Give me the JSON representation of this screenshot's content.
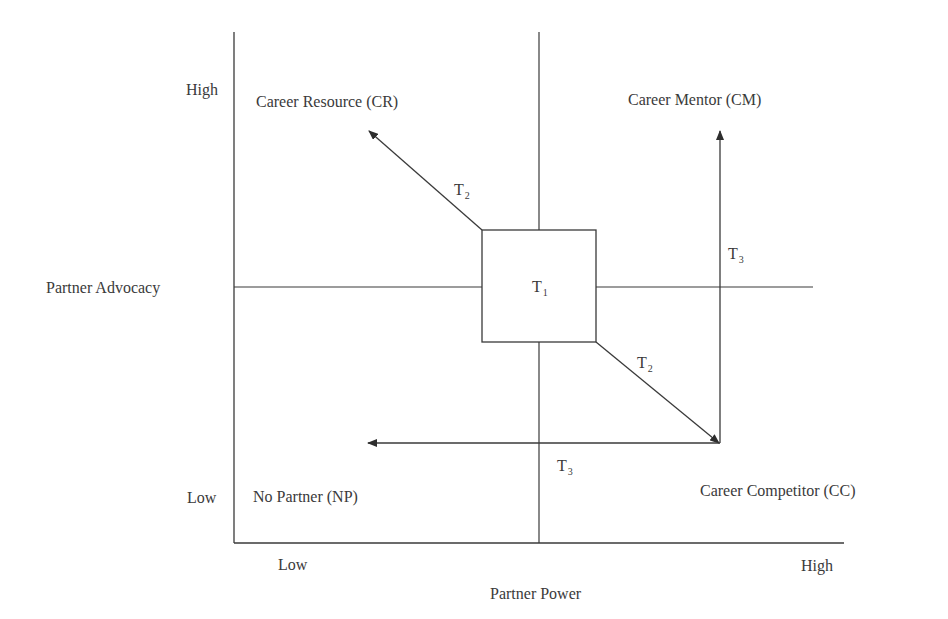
{
  "diagram": {
    "y_axis": {
      "title": "Partner Advocacy",
      "high_label": "High",
      "low_label": "Low"
    },
    "x_axis": {
      "title": "Partner Power",
      "low_label": "Low",
      "high_label": "High"
    },
    "quadrants": {
      "top_left": "Career Resource (CR)",
      "top_right": "Career Mentor (CM)",
      "bottom_left": "No Partner (NP)",
      "bottom_right": "Career Competitor (CC)"
    },
    "center_box": {
      "label": "T",
      "subscript": "1"
    },
    "transitions": [
      {
        "id": "t2_to_cr",
        "label": "T",
        "subscript": "2",
        "from": "T1",
        "to": "Career Resource (CR)"
      },
      {
        "id": "t2_to_cc",
        "label": "T",
        "subscript": "2",
        "from": "T1",
        "to": "Career Competitor (CC)"
      },
      {
        "id": "t3_to_cm",
        "label": "T",
        "subscript": "3",
        "from": "Career Competitor (CC)",
        "to": "Career Mentor (CM)"
      },
      {
        "id": "t3_to_np",
        "label": "T",
        "subscript": "3",
        "from": "Career Competitor (CC)",
        "to": "No Partner (NP)"
      }
    ],
    "line_color": "#3a3a3a"
  }
}
